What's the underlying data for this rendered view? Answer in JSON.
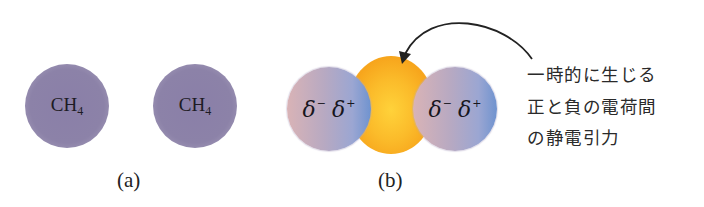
{
  "panel_a": {
    "caption": "(a)",
    "molecules": [
      {
        "label_main": "CH",
        "label_sub": "4"
      },
      {
        "label_main": "CH",
        "label_sub": "4"
      }
    ]
  },
  "panel_b": {
    "caption": "(b)",
    "molecules": [
      {
        "delta_minus": "δ",
        "minus_sign": "−",
        "delta_plus": "δ",
        "plus_sign": "+"
      },
      {
        "delta_minus": "δ",
        "minus_sign": "−",
        "delta_plus": "δ",
        "plus_sign": "+"
      }
    ],
    "attraction_region": "orange-cloud"
  },
  "annotation": {
    "lines": [
      "一時的に生じる",
      "正と負の電荷間",
      "の静電引力"
    ]
  },
  "colors": {
    "ch4_molecule": "#8c82a8",
    "polar_negative_side": "#d9b3b6",
    "polar_positive_side": "#6f93cf",
    "attraction_cloud": "#f9b024",
    "arrow": "#222222"
  }
}
